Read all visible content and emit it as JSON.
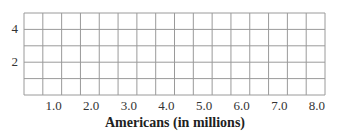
{
  "chart_data": {
    "type": "line",
    "title": "",
    "xlabel": "Americans (in millions)",
    "ylabel": "",
    "x_tick_labels": [
      "1.0",
      "2.0",
      "3.0",
      "4.0",
      "5.0",
      "6.0",
      "7.0",
      "8.0"
    ],
    "y_tick_labels": [
      "4",
      "2"
    ],
    "xlim": [
      0,
      8.0
    ],
    "ylim": [
      0,
      5
    ],
    "grid": true,
    "grid_columns": 16,
    "grid_rows": 5,
    "series": [],
    "note": "Empty grid with no plotted data"
  },
  "colors": {
    "grid": "#9a9a9a",
    "text": "#222222"
  }
}
